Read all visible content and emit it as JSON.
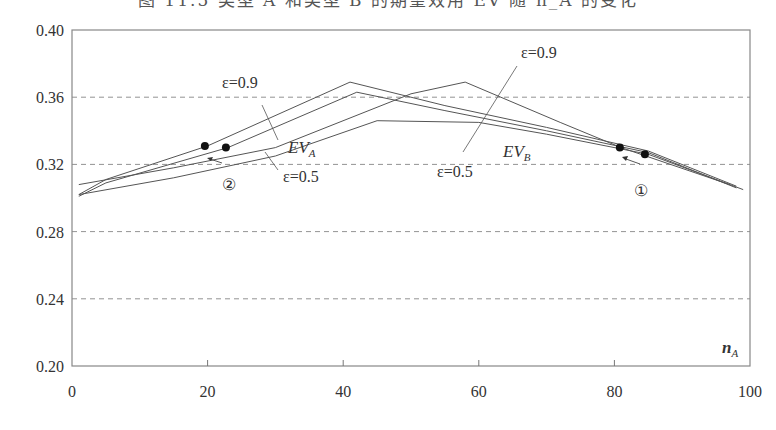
{
  "title_clipped": "图 11.5  类型 A 和类型 B 的期望效用 EV 随 n_A 的变化",
  "chart_data": {
    "type": "line",
    "title": "",
    "xlabel": "n_A",
    "ylabel": "",
    "xlim": [
      0,
      100
    ],
    "ylim": [
      0.2,
      0.4
    ],
    "x_ticks": [
      "0",
      "20",
      "40",
      "60",
      "80",
      "100"
    ],
    "y_ticks": [
      "0.40",
      "0.36",
      "0.32",
      "0.28",
      "0.24",
      "0.20"
    ],
    "grid": "horizontal dashed at 0.24, 0.28, 0.32, 0.36",
    "legend": "none (inline annotations)",
    "series": [
      {
        "name": "EV_A, ε=0.9",
        "x": [
          1,
          5,
          20,
          41,
          55,
          70,
          85,
          98
        ],
        "y": [
          0.302,
          0.311,
          0.331,
          0.369,
          0.355,
          0.342,
          0.328,
          0.307
        ]
      },
      {
        "name": "EV_A, ε=0.5",
        "x": [
          1,
          5,
          23,
          42,
          55,
          70,
          85,
          98
        ],
        "y": [
          0.301,
          0.309,
          0.33,
          0.363,
          0.352,
          0.34,
          0.327,
          0.306
        ]
      },
      {
        "name": "EV_B, ε=0.9",
        "x": [
          1,
          15,
          30,
          50,
          58,
          72,
          81,
          97
        ],
        "y": [
          0.308,
          0.318,
          0.33,
          0.362,
          0.369,
          0.345,
          0.33,
          0.308
        ]
      },
      {
        "name": "EV_B, ε=0.5",
        "x": [
          1,
          15,
          30,
          45,
          60,
          70,
          85,
          99
        ],
        "y": [
          0.302,
          0.312,
          0.325,
          0.346,
          0.345,
          0.338,
          0.326,
          0.305
        ]
      }
    ],
    "equilibrium_points": [
      {
        "x": 19.6,
        "y": 0.331
      },
      {
        "x": 22.7,
        "y": 0.33
      },
      {
        "x": 80.8,
        "y": 0.33
      },
      {
        "x": 84.5,
        "y": 0.326
      }
    ],
    "annotations": [
      {
        "text": "ε=0.9",
        "near": "EV_A upper curve",
        "x": 26,
        "y": 0.378
      },
      {
        "text": "EV_A",
        "x": 33,
        "y": 0.327
      },
      {
        "text": "ε=0.5",
        "near": "EV_A lower curve",
        "x": 29,
        "y": 0.315
      },
      {
        "text": "ε=0.9",
        "near": "EV_B upper curve",
        "x": 67,
        "y": 0.387
      },
      {
        "text": "EV_B",
        "x": 64,
        "y": 0.327
      },
      {
        "text": "ε=0.5",
        "near": "EV_B lower curve",
        "x": 55,
        "y": 0.313
      },
      {
        "text": "②",
        "x": 22,
        "y": 0.315
      },
      {
        "text": "①",
        "x": 84,
        "y": 0.311
      }
    ]
  },
  "labels": {
    "xaxis_var": "n",
    "xaxis_sub": "A",
    "eps09_a": "ε=0.9",
    "eps05_a": "ε=0.5",
    "eps09_b": "ε=0.9",
    "eps05_b": "ε=0.5",
    "ev": "EV",
    "ev_a_sub": "A",
    "ev_b_sub": "B",
    "circle2": "②",
    "circle1": "①"
  }
}
